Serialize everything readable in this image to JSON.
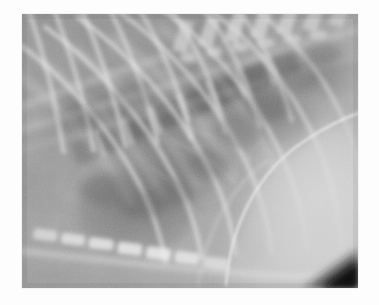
{
  "page": {
    "background_color": "#fdfdfd",
    "width": 379,
    "height": 305
  },
  "image": {
    "kind": "radiograph",
    "modality": "X-ray",
    "view": "lateral thoracic",
    "subject": "veterinary thorax",
    "caption": "",
    "frame": {
      "x": 22,
      "y": 14,
      "width": 336,
      "height": 274
    },
    "overlay_text": "",
    "labels": [],
    "annotations": [],
    "palette": {
      "background": "#fdfdfd",
      "film_base": "#9a9a9a",
      "soft_tissue_mid": "#a8a8a8",
      "lung_dark": "#6e6e6e",
      "vertebra_dark": "#656565",
      "bone_bright": "#d2d2d2",
      "bone_highlight": "#e2e2e2",
      "diaphragm_bright": "#c2c2c2",
      "corner_dark": "#141414",
      "heart_shadow": "#6a6a6a"
    },
    "anatomy": [
      {
        "name": "thoracic-vertebrae",
        "region": "upper-right-diagonal"
      },
      {
        "name": "spinous-processes",
        "region": "top-right"
      },
      {
        "name": "ribs",
        "region": "full-field-diagonal"
      },
      {
        "name": "lung-field",
        "region": "central"
      },
      {
        "name": "cardiac-silhouette",
        "region": "center-left"
      },
      {
        "name": "diaphragm",
        "region": "right"
      },
      {
        "name": "liver",
        "region": "lower-right"
      },
      {
        "name": "sternum-sternebrae",
        "region": "bottom-left"
      },
      {
        "name": "trachea",
        "region": "upper-left-diagonal"
      }
    ]
  }
}
